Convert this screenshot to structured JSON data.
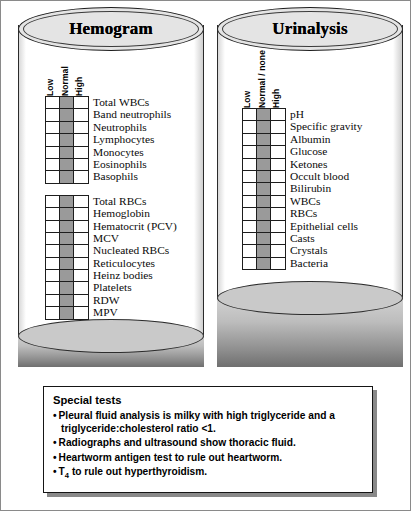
{
  "page": {
    "background": "#ffffff",
    "shade_color": "#9a9a9a"
  },
  "hemogram": {
    "title": "Hemogram",
    "headers": [
      "Low",
      "Normal",
      "High"
    ],
    "blocks": [
      {
        "name": "wbc-block",
        "rows": [
          {
            "label": "Total WBCs",
            "marked": "Normal"
          },
          {
            "label": "Band neutrophils",
            "marked": "Normal"
          },
          {
            "label": "Neutrophils",
            "marked": "Normal"
          },
          {
            "label": "Lymphocytes",
            "marked": "Normal"
          },
          {
            "label": "Monocytes",
            "marked": "Normal"
          },
          {
            "label": "Eosinophils",
            "marked": "Normal"
          },
          {
            "label": "Basophils",
            "marked": "Normal"
          }
        ]
      },
      {
        "name": "rbc-block",
        "rows": [
          {
            "label": "Total RBCs",
            "marked": "Normal"
          },
          {
            "label": "Hemoglobin",
            "marked": "Normal"
          },
          {
            "label": "Hematocrit (PCV)",
            "marked": "Normal"
          },
          {
            "label": "MCV",
            "marked": "Normal"
          },
          {
            "label": "Nucleated RBCs",
            "marked": "Normal"
          },
          {
            "label": "Reticulocytes",
            "marked": "Normal"
          },
          {
            "label": "Heinz bodies",
            "marked": "Normal"
          },
          {
            "label": "Platelets",
            "marked": "Normal"
          },
          {
            "label": "RDW",
            "marked": "Normal"
          },
          {
            "label": "MPV",
            "marked": "Normal"
          }
        ]
      }
    ]
  },
  "urinalysis": {
    "title": "Urinalysis",
    "headers": [
      "Low",
      "Normal / none",
      "High"
    ],
    "blocks": [
      {
        "name": "urine-block",
        "rows": [
          {
            "label": "pH",
            "marked": "Normal / none"
          },
          {
            "label": "Specific gravity",
            "marked": "Normal / none"
          },
          {
            "label": "Albumin",
            "marked": "Normal / none"
          },
          {
            "label": "Glucose",
            "marked": "Normal / none"
          },
          {
            "label": "Ketones",
            "marked": "Normal / none"
          },
          {
            "label": "Occult blood",
            "marked": "Normal / none"
          },
          {
            "label": "Bilirubin",
            "marked": "Normal / none"
          },
          {
            "label": "WBCs",
            "marked": "Normal / none"
          },
          {
            "label": "RBCs",
            "marked": "Normal / none"
          },
          {
            "label": "Epithelial cells",
            "marked": "Normal / none"
          },
          {
            "label": "Casts",
            "marked": "Normal / none"
          },
          {
            "label": "Crystals",
            "marked": "Normal / none"
          },
          {
            "label": "Bacteria",
            "marked": "Normal / none"
          }
        ]
      }
    ]
  },
  "special_tests": {
    "title": "Special tests",
    "bullet": "•",
    "items": [
      {
        "text": "Pleural fluid analysis is milky with high triglyceride and a triglyceride:cholesterol ratio <1."
      },
      {
        "text": "Radiographs and ultrasound show thoracic fluid."
      },
      {
        "text": "Heartworm antigen test to rule out heartworm."
      },
      {
        "pre": "T",
        "sub": "4",
        "post": " to rule out hyperthyroidism."
      }
    ]
  }
}
